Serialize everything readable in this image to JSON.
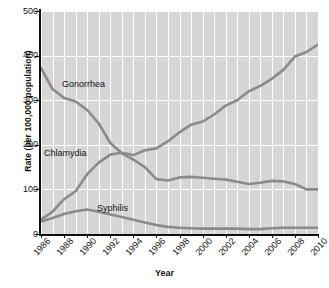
{
  "chart_data": {
    "type": "line",
    "title": "",
    "xlabel": "Year",
    "ylabel": "Rate (per 100,000 population)",
    "xlim": [
      1986,
      2010
    ],
    "ylim": [
      0,
      500
    ],
    "grid": true,
    "legend_position": "inline-labels",
    "y_ticks": [
      0,
      100,
      200,
      300,
      400,
      500
    ],
    "y_tick_labels": [
      "0",
      "100",
      "200",
      "300",
      "400",
      "500"
    ],
    "x_ticks": [
      1986,
      1988,
      1990,
      1992,
      1994,
      1996,
      1998,
      2000,
      2002,
      2004,
      2006,
      2008,
      2010
    ],
    "x_tick_labels": [
      "1986",
      "1988",
      "1990",
      "1992",
      "1994",
      "1996",
      "1998",
      "2000",
      "2002",
      "2004",
      "2006",
      "2008",
      "2010"
    ],
    "x": [
      1986,
      1987,
      1988,
      1989,
      1990,
      1991,
      1992,
      1993,
      1994,
      1995,
      1996,
      1997,
      1998,
      1999,
      2000,
      2001,
      2002,
      2003,
      2004,
      2005,
      2006,
      2007,
      2008,
      2009,
      2010
    ],
    "series": [
      {
        "name": "Gonorrhea",
        "color": "#8a8a8a",
        "values": [
          372,
          325,
          305,
          297,
          278,
          248,
          204,
          181,
          167,
          150,
          123,
          120,
          127,
          128,
          126,
          124,
          122,
          117,
          112,
          115,
          119,
          118,
          112,
          100,
          100
        ]
      },
      {
        "name": "Chlamydia",
        "color": "#8a8a8a",
        "values": [
          32,
          50,
          78,
          96,
          134,
          160,
          178,
          182,
          177,
          188,
          192,
          208,
          228,
          245,
          252,
          268,
          288,
          300,
          320,
          332,
          348,
          368,
          398,
          408,
          425
        ]
      },
      {
        "name": "Syphilis",
        "color": "#8a8a8a",
        "values": [
          28,
          36,
          45,
          51,
          55,
          50,
          44,
          38,
          32,
          26,
          20,
          16,
          14,
          13,
          12,
          12,
          12,
          12,
          11,
          11,
          13,
          14,
          14,
          14,
          14
        ]
      }
    ],
    "annotations": [
      {
        "text": "Gonorrhea",
        "name": "series-label-gonorrhea"
      },
      {
        "text": "Chlamydia",
        "name": "series-label-chlamydia"
      },
      {
        "text": "Syphilis",
        "name": "series-label-syphilis"
      }
    ]
  }
}
